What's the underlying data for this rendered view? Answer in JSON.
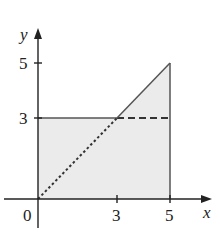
{
  "figure": {
    "axes": {
      "x_label": "x",
      "y_label": "y",
      "origin_label": "0",
      "x_ticks": [
        {
          "value": 3,
          "label": "3"
        },
        {
          "value": 5,
          "label": "5"
        }
      ],
      "y_ticks": [
        {
          "value": 3,
          "label": "3"
        },
        {
          "value": 5,
          "label": "5"
        }
      ]
    },
    "shaded_region": {
      "description": "Region under y=max(3,x) for 0<=x<=5",
      "vertices": [
        [
          0,
          0
        ],
        [
          0,
          3
        ],
        [
          3,
          3
        ],
        [
          5,
          5
        ],
        [
          5,
          0
        ]
      ],
      "fill": "#ebebeb"
    },
    "lines": [
      {
        "name": "y=3 solid",
        "from": [
          0,
          3
        ],
        "to": [
          3,
          3
        ],
        "style": "solid"
      },
      {
        "name": "y=3 dashed",
        "from": [
          3,
          3
        ],
        "to": [
          5,
          3
        ],
        "style": "dashed"
      },
      {
        "name": "y=x dotted",
        "from": [
          0,
          0
        ],
        "to": [
          3,
          3
        ],
        "style": "dotted"
      },
      {
        "name": "y=x solid",
        "from": [
          3,
          3
        ],
        "to": [
          5,
          5
        ],
        "style": "solid"
      },
      {
        "name": "x=5 solid",
        "from": [
          5,
          0
        ],
        "to": [
          5,
          5
        ],
        "style": "solid"
      }
    ],
    "colors": {
      "line": "#333333",
      "axis": "#222222",
      "fill": "#ebebeb"
    }
  }
}
